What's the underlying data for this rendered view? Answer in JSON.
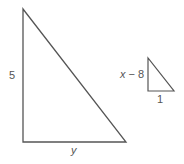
{
  "diagram": {
    "type": "similar-right-triangles",
    "stroke_color": "#555555",
    "large_triangle": {
      "vertical_leg_label": "5",
      "horizontal_leg_label": "y"
    },
    "small_triangle": {
      "vertical_leg_label": "x − 8",
      "horizontal_leg_label": "1"
    }
  }
}
